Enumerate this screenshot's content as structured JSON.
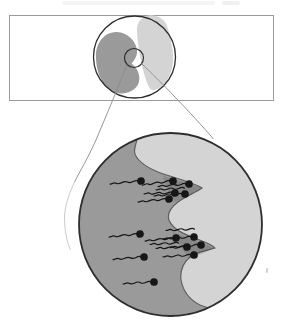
{
  "figure": {
    "type": "diagram",
    "colors": {
      "background": "#ffffff",
      "panel_border": "#9a9a9a",
      "outline": "#2e2e2e",
      "dark_mass": "#9a9a9a",
      "light_mass": "#d4d4d4",
      "boundary_line": "#5f5f5f",
      "callout_line": "#8a8a8a",
      "sperm": "#161616"
    },
    "overview": {
      "panel": {
        "x": 9.5,
        "y": 15.5,
        "width": 264,
        "height": 85
      },
      "egg_circle": {
        "cx": 134.5,
        "cy": 57,
        "r": 41
      },
      "magnifier_circle": {
        "cx": 134,
        "cy": 58,
        "r": 9.5
      }
    },
    "magnified": {
      "circle": {
        "cx": 170.5,
        "cy": 224.5,
        "r": 91.5
      },
      "notch_tips": [
        [
          202,
          188
        ],
        [
          215,
          248
        ]
      ],
      "sperm": [
        {
          "x": 141,
          "y": 181,
          "angle": -6
        },
        {
          "x": 173,
          "y": 181,
          "angle": -8
        },
        {
          "x": 189,
          "y": 184,
          "angle": -5
        },
        {
          "x": 187,
          "y": 188,
          "angle": -4,
          "tail_only": true
        },
        {
          "x": 175,
          "y": 193,
          "angle": -2
        },
        {
          "x": 185,
          "y": 194,
          "angle": -4
        },
        {
          "x": 169,
          "y": 199,
          "angle": -6
        },
        {
          "x": 140,
          "y": 234,
          "angle": -6
        },
        {
          "x": 176,
          "y": 238,
          "angle": -6
        },
        {
          "x": 194,
          "y": 237,
          "angle": -4
        },
        {
          "x": 197,
          "y": 229,
          "angle": -3,
          "tail_only": true
        },
        {
          "x": 201,
          "y": 245,
          "angle": -5
        },
        {
          "x": 187,
          "y": 247,
          "angle": -3
        },
        {
          "x": 181,
          "y": 243,
          "angle": -3,
          "tail_only": true
        },
        {
          "x": 194,
          "y": 255,
          "angle": -4
        },
        {
          "x": 144,
          "y": 257,
          "angle": -5
        },
        {
          "x": 154,
          "y": 282,
          "angle": -4
        }
      ]
    }
  }
}
